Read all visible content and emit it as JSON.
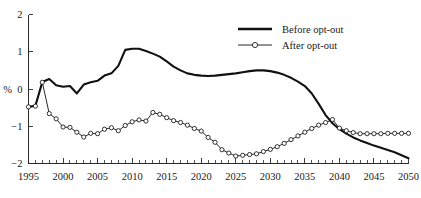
{
  "chart_data": {
    "type": "line",
    "title": "",
    "xlabel": "",
    "ylabel": "%",
    "xlim": [
      1995,
      2050
    ],
    "ylim": [
      -2,
      2
    ],
    "grid": false,
    "legend_position": "top-right",
    "x_ticks": [
      1995,
      2000,
      2005,
      2010,
      2015,
      2020,
      2025,
      2030,
      2035,
      2040,
      2045,
      2050
    ],
    "x_tick_labels": [
      "1995",
      "2000",
      "2005",
      "2010",
      "2015",
      "2020",
      "2025",
      "2030",
      "2035",
      "2040",
      "2045",
      "2050"
    ],
    "x_minor_tick_step": 1,
    "y_ticks": [
      -2,
      -1,
      0,
      1,
      2
    ],
    "y_tick_labels": [
      "−2",
      "−1",
      "0",
      "1",
      "2"
    ],
    "x": [
      1995,
      1996,
      1997,
      1998,
      1999,
      2000,
      2001,
      2002,
      2003,
      2004,
      2005,
      2006,
      2007,
      2008,
      2009,
      2010,
      2011,
      2012,
      2013,
      2014,
      2015,
      2016,
      2017,
      2018,
      2019,
      2020,
      2021,
      2022,
      2023,
      2024,
      2025,
      2026,
      2027,
      2028,
      2029,
      2030,
      2031,
      2032,
      2033,
      2034,
      2035,
      2036,
      2037,
      2038,
      2039,
      2040,
      2041,
      2042,
      2043,
      2044,
      2045,
      2046,
      2047,
      2048,
      2049,
      2050
    ],
    "series": [
      {
        "name": "Before opt-out",
        "style": "solid-thick",
        "marker": "none",
        "color": "#111111",
        "values": [
          -0.48,
          -0.45,
          0.19,
          0.27,
          0.1,
          0.06,
          0.08,
          -0.12,
          0.12,
          0.18,
          0.22,
          0.36,
          0.42,
          0.62,
          1.05,
          1.08,
          1.08,
          1.02,
          0.95,
          0.87,
          0.74,
          0.6,
          0.5,
          0.42,
          0.38,
          0.36,
          0.35,
          0.36,
          0.38,
          0.4,
          0.42,
          0.45,
          0.48,
          0.5,
          0.5,
          0.48,
          0.44,
          0.38,
          0.3,
          0.2,
          0.08,
          -0.12,
          -0.4,
          -0.7,
          -0.92,
          -1.08,
          -1.2,
          -1.3,
          -1.38,
          -1.45,
          -1.52,
          -1.58,
          -1.64,
          -1.7,
          -1.78,
          -1.86
        ]
      },
      {
        "name": "After opt-out",
        "style": "solid-thin",
        "marker": "circle",
        "color": "#111111",
        "values": [
          -0.48,
          -0.46,
          0.18,
          -0.66,
          -0.8,
          -1.02,
          -1.03,
          -1.16,
          -1.29,
          -1.19,
          -1.2,
          -1.08,
          -1.04,
          -1.12,
          -0.98,
          -0.88,
          -0.83,
          -0.86,
          -0.63,
          -0.68,
          -0.77,
          -0.85,
          -0.9,
          -0.97,
          -1.06,
          -1.13,
          -1.3,
          -1.43,
          -1.63,
          -1.72,
          -1.8,
          -1.78,
          -1.76,
          -1.74,
          -1.68,
          -1.62,
          -1.55,
          -1.46,
          -1.36,
          -1.26,
          -1.16,
          -1.06,
          -0.97,
          -0.9,
          -0.82,
          -0.76,
          -0.71,
          -0.67,
          -0.64,
          -0.62,
          -0.63,
          -0.64,
          -0.66,
          -0.7,
          -0.76,
          -0.84
        ]
      }
    ],
    "series_after_tail": {
      "note": "after opt-out right tail flattens near -1.2",
      "values_2040_2050": [
        -1.05,
        -1.12,
        -1.17,
        -1.2,
        -1.2,
        -1.2,
        -1.2,
        -1.19,
        -1.19,
        -1.19,
        -1.19
      ]
    },
    "legend": [
      {
        "label": "Before opt-out",
        "marker": "none",
        "line": "thick"
      },
      {
        "label": "After opt-out",
        "marker": "circle",
        "line": "thin"
      }
    ],
    "colors": {
      "axis": "#2a2a2a",
      "series": "#111111",
      "background": "#ffffff",
      "marker_fill": "#ffffff"
    }
  }
}
